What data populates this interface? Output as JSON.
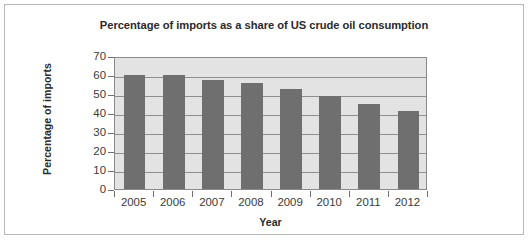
{
  "figure": {
    "background_color": "#ffffff",
    "border_color": "#b8b8b8"
  },
  "chart_data": {
    "type": "bar",
    "title": "Percentage of imports as a share of US crude oil consumption",
    "xlabel": "Year",
    "ylabel": "Percentage of imports",
    "categories": [
      "2005",
      "2006",
      "2007",
      "2008",
      "2009",
      "2010",
      "2011",
      "2012"
    ],
    "values": [
      60,
      60,
      57.5,
      56,
      52.5,
      49,
      45,
      41
    ],
    "ylim": [
      0,
      70
    ],
    "ytick_labels": [
      "0",
      "10",
      "20",
      "30",
      "40",
      "50",
      "60",
      "70"
    ],
    "ytick_values": [
      0,
      10,
      20,
      30,
      40,
      50,
      60,
      70
    ],
    "grid": true,
    "grid_axis": "y",
    "legend": false,
    "bar_color": "#6f6f6f",
    "plot_background_color": "#e3e3e3",
    "gridline_color": "#8f8f8f",
    "axis_color": "#8a8a8a"
  }
}
